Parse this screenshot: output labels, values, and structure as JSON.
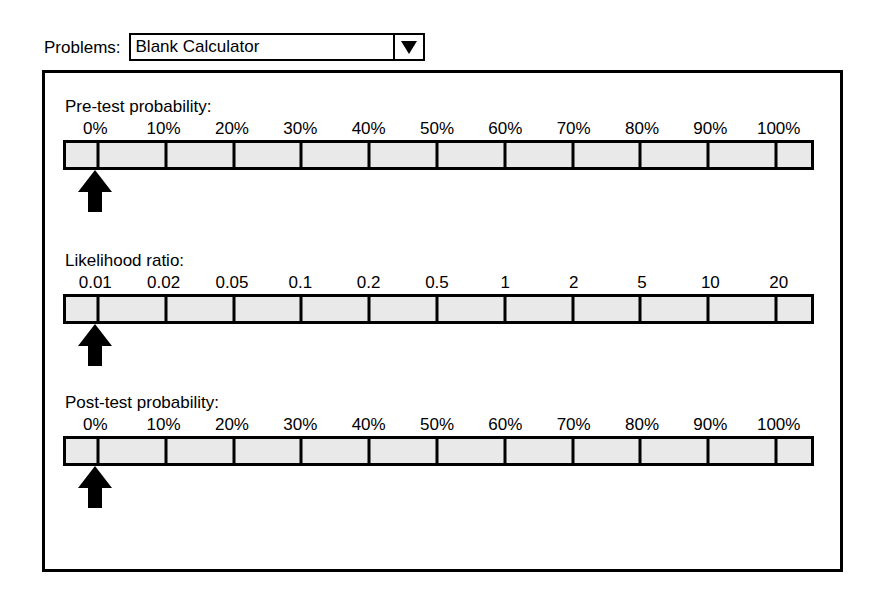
{
  "window": {
    "background": "#ffffff",
    "frame_color": "#000000"
  },
  "toolbar": {
    "problems_label": "Problems:",
    "problems_selected": "Blank Calculator",
    "dropdown_icon": "chevron-down-icon"
  },
  "panel": {
    "border_color": "#000000",
    "fill_color": "#ffffff"
  },
  "sliders": [
    {
      "id": "pre-test-probability",
      "title": "Pre-test probability:",
      "ticks": [
        "0%",
        "10%",
        "20%",
        "30%",
        "40%",
        "50%",
        "60%",
        "70%",
        "80%",
        "90%",
        "100%"
      ],
      "tick_positions_pct": [
        4.3,
        13.4,
        22.5,
        31.6,
        40.7,
        49.8,
        58.9,
        68.0,
        77.1,
        86.2,
        95.3
      ],
      "marker_value": "0%",
      "marker_position_pct": 4.3,
      "marker_icon": "up-arrow-marker",
      "track_color": "#e9e9e9",
      "border_color": "#000000"
    },
    {
      "id": "likelihood-ratio",
      "title": "Likelihood ratio:",
      "ticks": [
        "0.01",
        "0.02",
        "0.05",
        "0.1",
        "0.2",
        "0.5",
        "1",
        "2",
        "5",
        "10",
        "20"
      ],
      "tick_positions_pct": [
        4.3,
        13.4,
        22.5,
        31.6,
        40.7,
        49.8,
        58.9,
        68.0,
        77.1,
        86.2,
        95.3
      ],
      "marker_value": "0.01",
      "marker_position_pct": 4.3,
      "marker_icon": "up-arrow-marker",
      "track_color": "#e9e9e9",
      "border_color": "#000000"
    },
    {
      "id": "post-test-probability",
      "title": "Post-test probability:",
      "ticks": [
        "0%",
        "10%",
        "20%",
        "30%",
        "40%",
        "50%",
        "60%",
        "70%",
        "80%",
        "90%",
        "100%"
      ],
      "tick_positions_pct": [
        4.3,
        13.4,
        22.5,
        31.6,
        40.7,
        49.8,
        58.9,
        68.0,
        77.1,
        86.2,
        95.3
      ],
      "marker_value": "0%",
      "marker_position_pct": 4.3,
      "marker_icon": "up-arrow-marker",
      "track_color": "#e9e9e9",
      "border_color": "#000000"
    }
  ]
}
